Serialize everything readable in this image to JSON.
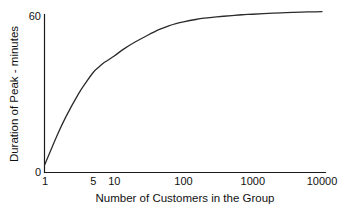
{
  "chart_data": {
    "type": "line",
    "title": "",
    "subtitle": "",
    "xlabel": "Number of Customers in the Group",
    "ylabel": "Duration of Peak - minutes",
    "xscale": "log",
    "yscale": "linear",
    "xlim": [
      1,
      10000
    ],
    "ylim": [
      0,
      60
    ],
    "xticks": [
      1,
      5,
      10,
      100,
      1000,
      10000
    ],
    "xticklabels": [
      "1",
      "5",
      "10",
      "100",
      "1000",
      "10000"
    ],
    "yticks": [
      0,
      60
    ],
    "yticklabels": [
      "0",
      "60"
    ],
    "grid": false,
    "legend": null,
    "annotations": [],
    "series": [
      {
        "name": "Duration of Peak",
        "color": "#2b2b2b",
        "x": [
          1,
          1.5,
          2,
          3,
          4,
          5,
          6,
          7,
          8,
          10,
          14,
          20,
          30,
          45,
          60,
          80,
          100,
          150,
          200,
          300,
          500,
          700,
          1000,
          2000,
          3000,
          5000,
          7000,
          10000
        ],
        "y": [
          3.0,
          14.0,
          21.0,
          29.5,
          34.5,
          38.0,
          40.0,
          41.5,
          42.5,
          44.2,
          47.0,
          49.5,
          52.0,
          54.3,
          55.6,
          56.6,
          57.2,
          58.1,
          58.6,
          59.1,
          59.6,
          59.9,
          60.1,
          60.5,
          60.7,
          60.9,
          61.0,
          61.1
        ]
      }
    ]
  },
  "axes": {
    "y_axis_top_label": "60",
    "y_axis_bottom_label": "0",
    "y_axis_title": "Duration of Peak - minutes",
    "x_axis_title": "Number of Customers in the Group",
    "x_tick_labels": [
      "1",
      "5",
      "10",
      "100",
      "1000",
      "10000"
    ]
  },
  "colors": {
    "background": "#ffffff",
    "axis": "#1a1a1a",
    "curve": "#2b2b2b",
    "text": "#111111"
  }
}
